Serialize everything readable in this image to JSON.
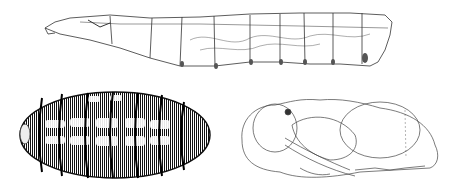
{
  "figure": {
    "background": "#ffffff",
    "ink": "#222222",
    "panels": [
      {
        "id": "larva",
        "description": "Larva, lateral view, line drawing"
      },
      {
        "id": "puparium",
        "description": "Puparium, dark banded, dorsal view"
      },
      {
        "id": "pupa",
        "description": "Pupa, lateral view, line drawing"
      }
    ]
  }
}
